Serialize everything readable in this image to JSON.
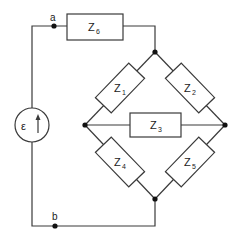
{
  "diagram": {
    "type": "circuit",
    "nodes": {
      "a": {
        "label": "a"
      },
      "b": {
        "label": "b"
      }
    },
    "source": {
      "label": "ε",
      "arrow": "up"
    },
    "impedances": [
      {
        "id": "Z6",
        "base": "Z",
        "sub": "6"
      },
      {
        "id": "Z1",
        "base": "Z",
        "sub": "1"
      },
      {
        "id": "Z2",
        "base": "Z",
        "sub": "2"
      },
      {
        "id": "Z3",
        "base": "Z",
        "sub": "3"
      },
      {
        "id": "Z4",
        "base": "Z",
        "sub": "4"
      },
      {
        "id": "Z5",
        "base": "Z",
        "sub": "5"
      }
    ],
    "colors": {
      "line": "#3a3a3a",
      "node": "#111111",
      "background": "#ffffff"
    }
  }
}
